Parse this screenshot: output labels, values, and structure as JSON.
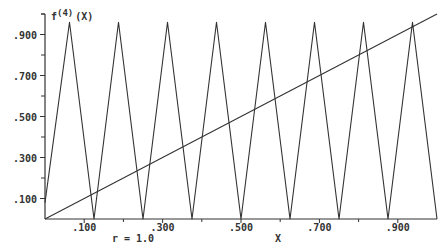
{
  "chart_data": {
    "type": "line",
    "title": "",
    "ylabel": "f(4)(X)",
    "ylabel_base": "f",
    "ylabel_superscript": "(4)",
    "ylabel_arg": "(X)",
    "xlabel": "X",
    "annotation": "r = 1.0",
    "xlim": [
      0,
      1
    ],
    "ylim": [
      0,
      1
    ],
    "grid": false,
    "legend": null,
    "x_tick_labels": [
      ".100",
      ".300",
      ".500",
      ".700",
      ".900"
    ],
    "x_ticks_major": [
      0.1,
      0.3,
      0.5,
      0.7,
      0.9
    ],
    "x_ticks_minor": [
      0.2,
      0.4,
      0.6,
      0.8
    ],
    "y_tick_labels": [
      ".100",
      ".300",
      ".500",
      ".700",
      ".900"
    ],
    "y_ticks_major": [
      0.1,
      0.3,
      0.5,
      0.7,
      0.9
    ],
    "y_ticks_minor": [
      0.2,
      0.4,
      0.6,
      0.8,
      1.0
    ],
    "series": [
      {
        "name": "f^(4)(x)",
        "x": [
          0,
          0.0625,
          0.125,
          0.1875,
          0.25,
          0.3125,
          0.375,
          0.4375,
          0.5,
          0.5625,
          0.625,
          0.6875,
          0.75,
          0.8125,
          0.875,
          0.9375,
          1.0
        ],
        "y": [
          0.08,
          0.96,
          0.0,
          0.96,
          0.0,
          0.96,
          0.0,
          0.96,
          0.0,
          0.96,
          0.0,
          0.96,
          0.0,
          0.96,
          0.0,
          0.96,
          0.0
        ]
      },
      {
        "name": "y = x",
        "x": [
          0,
          1
        ],
        "y": [
          0,
          1
        ]
      }
    ],
    "colors": {
      "lines": "#333333",
      "axes": "#333333",
      "background": "#ffffff"
    }
  }
}
